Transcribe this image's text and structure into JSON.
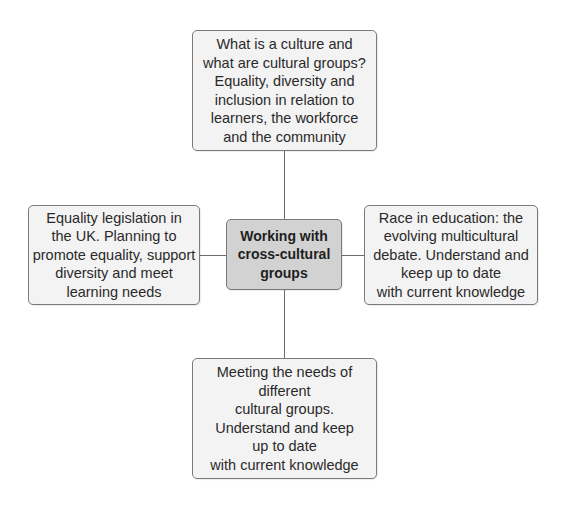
{
  "diagram": {
    "type": "mind-map",
    "center": {
      "label": "Working with\ncross-cultural\ngroups"
    },
    "nodes": {
      "top": {
        "label": "What is a culture and\nwhat are cultural groups?\nEquality, diversity and\ninclusion in relation to\nlearners, the workforce\nand the community"
      },
      "left": {
        "label": "Equality legislation in\nthe UK. Planning to\npromote equality, support\ndiversity and meet\nlearning needs"
      },
      "right": {
        "label": "Race in education:  the\nevolving multicultural\ndebate. Understand and\nkeep up to date\nwith current knowledge"
      },
      "bottom": {
        "label": "Meeting the needs of\ndifferent\ncultural groups.\nUnderstand and keep\nup to date\nwith current knowledge"
      }
    },
    "colors": {
      "center_fill": "#d2d2d2",
      "node_fill": "#f3f3f3",
      "border": "#7a7a7a",
      "connector": "#6b6b6b"
    }
  }
}
